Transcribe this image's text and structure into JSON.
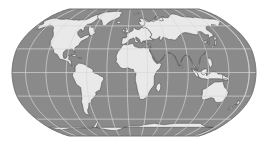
{
  "figure": {
    "kind": "world-map",
    "title": "",
    "width_px": 271,
    "height_px": 147
  },
  "map": {
    "projection": "robinson",
    "projection_label": "Robinson (pseudocylindrical) world projection",
    "center_longitude": 10,
    "background_color": "#ffffff",
    "ocean_color": "#8a8a8a",
    "land_color": "#e9e9e9",
    "coastline_color": "#4a4a4a",
    "graticule_color": "#d8d8d8",
    "frame_color": "#6e6e6e",
    "bounds_px": {
      "left": 12,
      "top": 9,
      "right": 256,
      "bottom": 136
    },
    "graticule": {
      "meridian_step_deg": 30,
      "parallel_step_deg": 30,
      "meridians_deg": [
        -180,
        -150,
        -120,
        -90,
        -60,
        -30,
        0,
        30,
        60,
        90,
        120,
        150,
        180
      ],
      "parallels_deg": [
        -60,
        -30,
        0,
        30,
        60
      ],
      "visible": true
    },
    "features": [
      "north-america",
      "south-america",
      "greenland",
      "europe",
      "africa",
      "asia",
      "australia",
      "antarctica",
      "madagascar",
      "japan",
      "indonesia",
      "new-zealand",
      "british-isles",
      "iceland"
    ],
    "chart_data": {
      "type": "map",
      "title": "",
      "xlabel": "Longitude",
      "ylabel": "Latitude",
      "xlim": [
        -180,
        180
      ],
      "ylim": [
        -90,
        90
      ],
      "grid": true,
      "legend": "none"
    }
  }
}
